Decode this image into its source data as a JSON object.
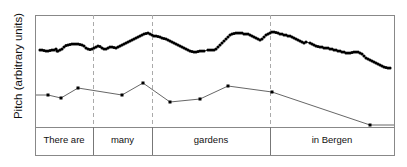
{
  "figure": {
    "width": 407,
    "height": 167,
    "background": "#ffffff"
  },
  "axis": {
    "ylabel": "Pitch (arbitrary units)"
  },
  "plot_box": {
    "left": 35,
    "right": 394,
    "top": 15,
    "bottom": 155,
    "separator_y": 127,
    "border_color": "#888888",
    "border_width": 1
  },
  "boundaries": {
    "dashed_color": "#aaaaaa",
    "solid_color": "#777777",
    "x_positions": [
      93,
      152,
      270
    ]
  },
  "segments": [
    {
      "label": "There are",
      "x_start": 35,
      "x_end": 93,
      "center": 64
    },
    {
      "label": "many",
      "x_start": 93,
      "x_end": 152,
      "center": 122.5
    },
    {
      "label": "gardens",
      "x_start": 152,
      "x_end": 270,
      "center": 211
    },
    {
      "label": "in Bergen",
      "x_start": 270,
      "x_end": 394,
      "center": 332
    }
  ],
  "chart_data": {
    "type": "line",
    "title": "",
    "xlabel": "",
    "ylabel": "Pitch (arbitrary units)",
    "xlim": [
      35,
      394
    ],
    "ylim_pixels": [
      15,
      127
    ],
    "grid": false,
    "legend": "none",
    "annotations": [
      "There are",
      "many",
      "gardens",
      "in Bergen"
    ],
    "series": [
      {
        "name": "pitch-contour",
        "style": "dotted-thick",
        "color": "#000000",
        "marker": "dot",
        "points": [
          [
            40,
            50
          ],
          [
            42,
            50
          ],
          [
            44,
            50.5
          ],
          [
            46,
            51
          ],
          [
            48,
            51
          ],
          [
            50,
            50.5
          ],
          [
            52,
            50
          ],
          [
            54,
            50
          ],
          [
            56,
            49
          ],
          [
            57,
            51
          ],
          [
            58,
            51
          ],
          [
            60,
            50
          ],
          [
            62,
            49
          ],
          [
            64,
            47
          ],
          [
            66,
            45.5
          ],
          [
            68,
            45
          ],
          [
            70,
            44.5
          ],
          [
            72,
            44
          ],
          [
            74,
            44
          ],
          [
            76,
            44
          ],
          [
            78,
            44
          ],
          [
            80,
            44.5
          ],
          [
            82,
            45
          ],
          [
            84,
            46
          ],
          [
            86,
            48
          ],
          [
            88,
            49
          ],
          [
            90,
            49.5
          ],
          [
            92,
            49
          ],
          [
            94,
            48
          ],
          [
            96,
            47
          ],
          [
            98,
            46
          ],
          [
            100,
            46.5
          ],
          [
            102,
            48
          ],
          [
            104,
            49
          ],
          [
            106,
            49
          ],
          [
            108,
            48
          ],
          [
            110,
            47
          ],
          [
            112,
            47
          ],
          [
            114,
            47.5
          ],
          [
            116,
            48
          ],
          [
            118,
            47
          ],
          [
            120,
            46
          ],
          [
            122,
            45
          ],
          [
            124,
            44
          ],
          [
            126,
            43
          ],
          [
            128,
            42
          ],
          [
            130,
            41
          ],
          [
            132,
            40
          ],
          [
            134,
            39
          ],
          [
            136,
            38
          ],
          [
            138,
            37
          ],
          [
            140,
            36
          ],
          [
            142,
            35
          ],
          [
            144,
            34
          ],
          [
            146,
            33.5
          ],
          [
            148,
            33
          ],
          [
            150,
            34
          ],
          [
            152,
            35
          ],
          [
            154,
            36
          ],
          [
            156,
            36
          ],
          [
            158,
            36.5
          ],
          [
            160,
            37
          ],
          [
            162,
            38
          ],
          [
            164,
            38.5
          ],
          [
            166,
            39
          ],
          [
            168,
            40
          ],
          [
            170,
            41
          ],
          [
            172,
            42
          ],
          [
            174,
            43
          ],
          [
            176,
            44
          ],
          [
            178,
            45
          ],
          [
            180,
            46
          ],
          [
            182,
            47
          ],
          [
            184,
            48
          ],
          [
            186,
            49
          ],
          [
            188,
            50
          ],
          [
            190,
            51
          ],
          [
            192,
            51.5
          ],
          [
            194,
            52
          ],
          [
            196,
            52
          ],
          [
            198,
            51.5
          ],
          [
            200,
            51
          ],
          [
            202,
            51
          ],
          [
            204,
            51
          ],
          [
            208,
            50
          ],
          [
            210,
            50
          ],
          [
            212,
            50
          ],
          [
            214,
            50
          ],
          [
            216,
            49
          ],
          [
            218,
            47
          ],
          [
            220,
            45
          ],
          [
            222,
            43
          ],
          [
            224,
            41
          ],
          [
            226,
            39
          ],
          [
            228,
            37
          ],
          [
            230,
            35
          ],
          [
            232,
            34
          ],
          [
            234,
            33.5
          ],
          [
            236,
            33
          ],
          [
            238,
            33
          ],
          [
            240,
            33
          ],
          [
            242,
            33
          ],
          [
            244,
            34
          ],
          [
            246,
            34
          ],
          [
            248,
            34
          ],
          [
            250,
            35
          ],
          [
            252,
            36
          ],
          [
            254,
            37
          ],
          [
            256,
            38
          ],
          [
            258,
            39
          ],
          [
            260,
            40
          ],
          [
            262,
            39
          ],
          [
            264,
            37
          ],
          [
            266,
            35
          ],
          [
            268,
            34
          ],
          [
            270,
            33
          ],
          [
            272,
            32
          ],
          [
            274,
            32
          ],
          [
            276,
            32.5
          ],
          [
            278,
            33
          ],
          [
            280,
            34
          ],
          [
            282,
            34
          ],
          [
            284,
            35
          ],
          [
            286,
            35
          ],
          [
            288,
            36
          ],
          [
            290,
            36
          ],
          [
            292,
            37
          ],
          [
            294,
            38
          ],
          [
            296,
            39
          ],
          [
            298,
            40
          ],
          [
            300,
            41
          ],
          [
            302,
            42
          ],
          [
            304,
            43
          ],
          [
            306,
            42
          ],
          [
            310,
            43
          ],
          [
            312,
            44
          ],
          [
            314,
            45
          ],
          [
            316,
            46
          ],
          [
            318,
            46.5
          ],
          [
            320,
            47
          ],
          [
            322,
            47
          ],
          [
            324,
            48
          ],
          [
            326,
            48
          ],
          [
            328,
            48
          ],
          [
            330,
            49
          ],
          [
            332,
            49
          ],
          [
            334,
            50
          ],
          [
            336,
            50
          ],
          [
            338,
            51
          ],
          [
            340,
            51
          ],
          [
            342,
            52
          ],
          [
            344,
            52
          ],
          [
            346,
            53
          ],
          [
            348,
            53
          ],
          [
            350,
            53
          ],
          [
            352,
            52.5
          ],
          [
            354,
            52
          ],
          [
            356,
            52
          ],
          [
            358,
            52
          ],
          [
            360,
            53
          ],
          [
            362,
            54
          ],
          [
            364,
            56
          ],
          [
            366,
            58
          ],
          [
            368,
            59
          ],
          [
            370,
            60
          ],
          [
            372,
            61
          ],
          [
            374,
            62
          ],
          [
            376,
            63
          ],
          [
            378,
            64
          ],
          [
            380,
            65
          ],
          [
            382,
            66
          ],
          [
            384,
            67
          ],
          [
            386,
            67.5
          ],
          [
            388,
            68
          ],
          [
            390,
            68
          ]
        ]
      },
      {
        "name": "pitch-targets",
        "style": "thin-line-with-markers",
        "color": "#555555",
        "marker": "square",
        "points": [
          [
            36,
            95
          ],
          [
            48,
            95
          ],
          [
            61,
            98
          ],
          [
            78,
            88
          ],
          [
            122,
            95
          ],
          [
            143,
            83
          ],
          [
            170,
            102
          ],
          [
            200,
            99
          ],
          [
            228,
            86
          ],
          [
            272,
            92
          ],
          [
            370,
            125
          ],
          [
            394,
            125
          ]
        ]
      }
    ]
  }
}
